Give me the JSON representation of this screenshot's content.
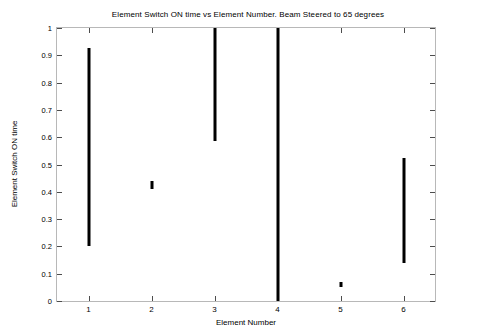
{
  "chart_data": {
    "type": "bar",
    "title": "Element Switch ON time vs Element Number. Beam Steered to 65 degrees",
    "xlabel": "Element Number",
    "ylabel": "Element Switch ON time",
    "xlim": [
      0.5,
      6.5
    ],
    "ylim": [
      0,
      1
    ],
    "grid": false,
    "legend": null,
    "orientation": "vertical-interval-bars",
    "note": "Each element is drawn as a vertical black line spanning its switch-ON interval (start to stop).",
    "categories": [
      "1",
      "2",
      "3",
      "4",
      "5",
      "6"
    ],
    "x": [
      1,
      2,
      3,
      4,
      5,
      6
    ],
    "series": [
      {
        "name": "Switch ON interval start",
        "values": [
          0.2,
          0.41,
          0.585,
          0.0,
          0.05,
          0.14
        ]
      },
      {
        "name": "Switch ON interval stop",
        "values": [
          0.925,
          0.44,
          1.0,
          1.0,
          0.07,
          0.525
        ]
      }
    ],
    "bars": [
      {
        "element": "1",
        "x": 1,
        "y_start": 0.2,
        "y_stop": 0.925
      },
      {
        "element": "2",
        "x": 2,
        "y_start": 0.41,
        "y_stop": 0.44
      },
      {
        "element": "3",
        "x": 3,
        "y_start": 0.585,
        "y_stop": 1.0
      },
      {
        "element": "4",
        "x": 4,
        "y_start": 0.0,
        "y_stop": 1.0
      },
      {
        "element": "5",
        "x": 5,
        "y_start": 0.05,
        "y_stop": 0.07
      },
      {
        "element": "6",
        "x": 6,
        "y_start": 0.14,
        "y_stop": 0.525
      }
    ],
    "yticks": [
      0,
      0.1,
      0.2,
      0.3,
      0.4,
      0.5,
      0.6,
      0.7,
      0.8,
      0.9,
      1
    ],
    "ytick_labels": [
      "0",
      "0.1",
      "0.2",
      "0.3",
      "0.4",
      "0.5",
      "0.6",
      "0.7",
      "0.8",
      "0.9",
      "1"
    ],
    "xticks": [
      1,
      2,
      3,
      4,
      5,
      6
    ],
    "xtick_labels": [
      "1",
      "2",
      "3",
      "4",
      "5",
      "6"
    ],
    "colors": {
      "bar": "#000000",
      "axis": "#b8b8b8",
      "tick": "#4d4d4d",
      "text": "#000000",
      "background": "#ffffff"
    }
  }
}
